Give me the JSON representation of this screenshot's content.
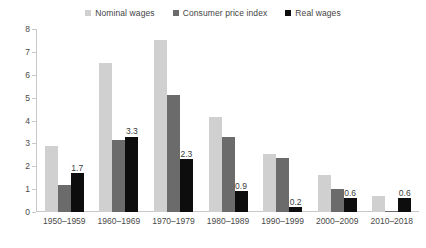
{
  "chart_data": {
    "type": "bar",
    "title": "",
    "xlabel": "",
    "ylabel": "",
    "ylim": [
      0,
      8
    ],
    "yticks": [
      0,
      1,
      2,
      3,
      4,
      5,
      6,
      7,
      8
    ],
    "grid": false,
    "legend_position": "top-center",
    "categories": [
      "1950–1959",
      "1960–1969",
      "1970–1979",
      "1980–1989",
      "1990–1999",
      "2000–2009",
      "2010–2018"
    ],
    "series": [
      {
        "name": "Nominal wages",
        "color": "#d0d0d0",
        "values": [
          2.9,
          6.5,
          7.5,
          4.15,
          2.55,
          1.6,
          0.7
        ],
        "labels": [
          "",
          "",
          "",
          "",
          "",
          "",
          ""
        ]
      },
      {
        "name": "Consumer price index",
        "color": "#6b6b6b",
        "values": [
          1.2,
          3.15,
          5.1,
          3.3,
          2.35,
          1.0,
          0.05
        ],
        "labels": [
          "",
          "",
          "",
          "",
          "",
          "",
          ""
        ]
      },
      {
        "name": "Real wages",
        "color": "#0d0d0d",
        "values": [
          1.7,
          3.3,
          2.3,
          0.9,
          0.2,
          0.6,
          0.6
        ],
        "labels": [
          "1.7",
          "3.3",
          "2.3",
          "0.9",
          "0.2",
          "0.6",
          "0.6"
        ]
      }
    ]
  },
  "legend": {
    "items": [
      {
        "label": "Nominal wages",
        "color": "#d0d0d0"
      },
      {
        "label": "Consumer price index",
        "color": "#6b6b6b"
      },
      {
        "label": "Real wages",
        "color": "#0d0d0d"
      }
    ]
  },
  "axis": {
    "y_tick_labels": [
      "8",
      "7",
      "6",
      "5",
      "4",
      "3",
      "2",
      "1",
      "0"
    ]
  }
}
